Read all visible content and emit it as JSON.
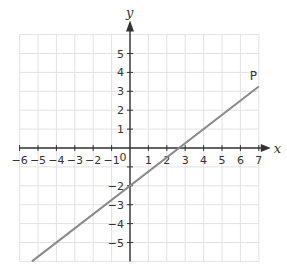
{
  "chart_data": {
    "type": "line",
    "title": "",
    "xlabel": "x",
    "ylabel": "y",
    "xlim": [
      -6,
      7
    ],
    "ylim": [
      -6,
      6
    ],
    "grid": true,
    "x_ticks": [
      "−6",
      "−5",
      "−4",
      "−3",
      "−2",
      "−1",
      "0",
      "1",
      "2",
      "3",
      "4",
      "5",
      "6",
      "7"
    ],
    "y_ticks": [
      "5",
      "4",
      "3",
      "2",
      "1",
      "−2",
      "−3",
      "−4",
      "−5"
    ],
    "origin_label": "0",
    "series": [
      {
        "name": "P",
        "equation": "y = 0.75x − 2",
        "x": [
          -5.33,
          7
        ],
        "y": [
          -6,
          3.25
        ],
        "color": "#8a8a8a"
      }
    ],
    "annotations": [
      {
        "text": "P",
        "x": 6.7,
        "y": 3.6
      }
    ]
  },
  "colors": {
    "grid": "#e2e2e2",
    "axis": "#333333",
    "line": "#8a8a8a"
  }
}
